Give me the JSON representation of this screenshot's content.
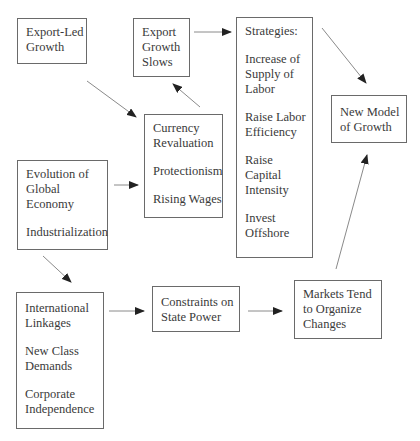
{
  "diagram": {
    "nodes": {
      "export_led_growth": {
        "lines": [
          "Export-Led",
          "Growth"
        ]
      },
      "export_growth_slows": {
        "lines": [
          "Export",
          "Growth",
          "Slows"
        ]
      },
      "strategies": {
        "title": "Strategies:",
        "items": [
          [
            "Increase of",
            "Supply of",
            "Labor"
          ],
          [
            "Raise Labor",
            "Efficiency"
          ],
          [
            "Raise",
            "Capital",
            "Intensity"
          ],
          [
            "Invest",
            "Offshore"
          ]
        ]
      },
      "new_model_of_growth": {
        "lines": [
          "New Model",
          "of Growth"
        ]
      },
      "responses": {
        "items": [
          [
            "Currency",
            "Revaluation"
          ],
          [
            "Protectionism"
          ],
          [
            "Rising Wages"
          ]
        ]
      },
      "evolution": {
        "items": [
          [
            "Evolution of",
            "Global",
            "Economy"
          ],
          [
            "Industrialization"
          ]
        ]
      },
      "linkages": {
        "items": [
          [
            "International",
            "Linkages"
          ],
          [
            "New Class",
            "Demands"
          ],
          [
            "Corporate",
            "Independence"
          ]
        ]
      },
      "constraints": {
        "lines": [
          "Constraints on",
          "State Power"
        ]
      },
      "markets": {
        "lines": [
          "Markets Tend",
          "to Organize",
          "Changes"
        ]
      }
    },
    "edges": [
      {
        "from": "export_led_growth",
        "to": "responses"
      },
      {
        "from": "responses",
        "to": "export_growth_slows"
      },
      {
        "from": "export_growth_slows",
        "to": "strategies"
      },
      {
        "from": "strategies",
        "to": "new_model_of_growth"
      },
      {
        "from": "evolution",
        "to": "responses"
      },
      {
        "from": "evolution",
        "to": "linkages"
      },
      {
        "from": "linkages",
        "to": "constraints"
      },
      {
        "from": "constraints",
        "to": "markets"
      },
      {
        "from": "markets",
        "to": "new_model_of_growth"
      }
    ],
    "colors": {
      "border": "#6a6a6a",
      "text": "#3a3a3a",
      "arrow": "#222222",
      "line": "#8a8a8a"
    }
  }
}
